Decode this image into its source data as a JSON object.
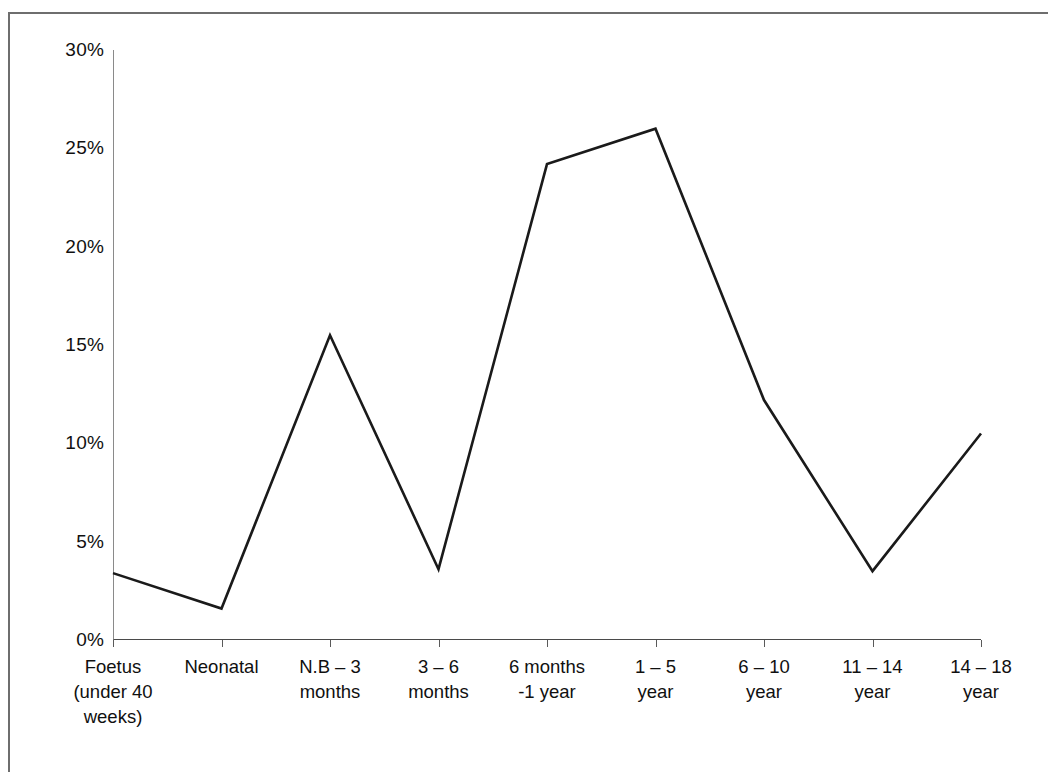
{
  "chart_data": {
    "type": "line",
    "title": "",
    "subtitle": "",
    "xlabel": "",
    "ylabel": "",
    "grid": true,
    "legend": false,
    "legend_position": "none",
    "markers": false,
    "line_color": "#1a1a1a",
    "grid_color": "#c9c9c9",
    "axis_color": "#4a4a4a",
    "background_color": "#ffffff",
    "ylim": [
      0,
      30
    ],
    "ytick_step": 5,
    "y_tick_labels": [
      "30%",
      "25%",
      "20%",
      "15%",
      "10%",
      "5%",
      "0%"
    ],
    "y_tick_values": [
      30,
      25,
      20,
      15,
      10,
      5,
      0
    ],
    "categories": [
      "Foetus\n(under 40\nweeks)",
      "Neonatal",
      "N.B – 3\nmonths",
      "3 – 6\nmonths",
      "6 months\n-1 year",
      "1 – 5\nyear",
      "6 – 10\nyear",
      "11 – 14\nyear",
      "14 – 18\nyear"
    ],
    "series": [
      {
        "name": "Percentage",
        "values": [
          3.4,
          1.6,
          15.5,
          3.6,
          24.2,
          26.0,
          12.2,
          3.5,
          10.5
        ]
      }
    ]
  }
}
